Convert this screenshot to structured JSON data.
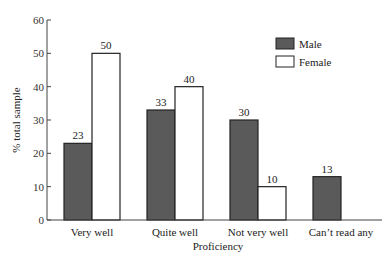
{
  "chart_data": {
    "type": "bar",
    "title": "",
    "xlabel": "Proficiency",
    "ylabel": "% total sample",
    "ylim": [
      0,
      60
    ],
    "yticks": [
      0,
      10,
      20,
      30,
      40,
      50,
      60
    ],
    "grid": false,
    "legend_position": "top-right",
    "categories": [
      "Very well",
      "Quite well",
      "Not very well",
      "Can’t read any"
    ],
    "series": [
      {
        "name": "Male",
        "color": "#5a5a5a",
        "values": [
          23,
          33,
          30,
          13
        ]
      },
      {
        "name": "Female",
        "color": "#ffffff",
        "values": [
          50,
          40,
          10,
          null
        ]
      }
    ],
    "data_labels": {
      "Male": [
        "23",
        "33",
        "30",
        "13"
      ],
      "Female": [
        "50",
        "40",
        "10",
        ""
      ]
    }
  }
}
